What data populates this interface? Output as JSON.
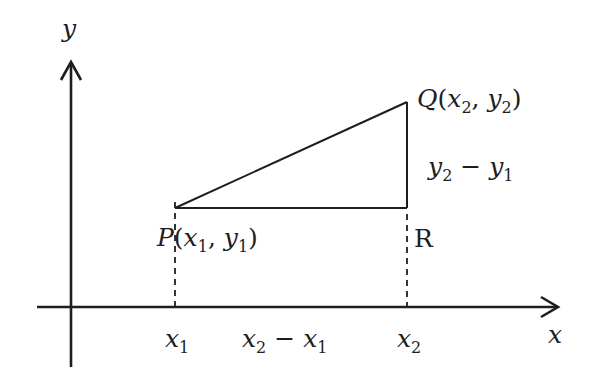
{
  "diagram": {
    "type": "coordinate-geometry",
    "colors": {
      "stroke": "#1e1e1e",
      "background": "#ffffff"
    },
    "axes": {
      "x_label": "x",
      "y_label": "y"
    },
    "points": {
      "P": {
        "name": "P",
        "coord_x": "x",
        "coord_x_sub": "1",
        "coord_y": "y",
        "coord_y_sub": "1"
      },
      "Q": {
        "name": "Q",
        "coord_x": "x",
        "coord_x_sub": "2",
        "coord_y": "y",
        "coord_y_sub": "2"
      },
      "R": {
        "name": "R"
      }
    },
    "labels": {
      "vertical_diff": {
        "a": "y",
        "a_sub": "2",
        "op": " − ",
        "b": "y",
        "b_sub": "1"
      },
      "horizontal_diff": {
        "a": "x",
        "a_sub": "2",
        "op": " − ",
        "b": "x",
        "b_sub": "1"
      },
      "x1_tick": {
        "v": "x",
        "sub": "1"
      },
      "x2_tick": {
        "v": "x",
        "sub": "2"
      }
    },
    "punct": {
      "open": "(",
      "comma": ", ",
      "close": ")"
    }
  }
}
